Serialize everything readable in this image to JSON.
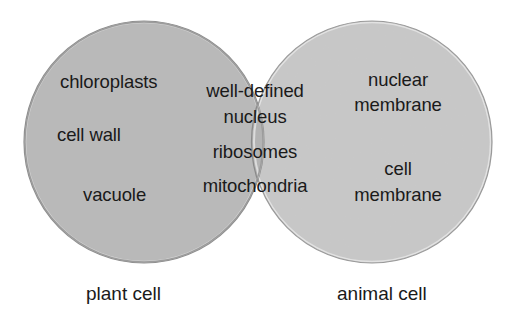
{
  "diagram": {
    "type": "venn",
    "sets": [
      {
        "name": "plant cell",
        "fill": "#b9b9b9",
        "unique_items": [
          "chloroplasts",
          "cell wall",
          "vacuole"
        ]
      },
      {
        "name": "animal cell",
        "fill": "#c8c8c8",
        "unique_items": [
          "nuclear membrane",
          "cell membrane"
        ]
      }
    ],
    "intersection": {
      "fill": "#b3b3b3",
      "items": [
        "well-defined nucleus",
        "ribosomes",
        "mitochondria"
      ]
    }
  },
  "labels": {
    "plant": {
      "item1": "chloroplasts",
      "item2": "cell wall",
      "item3": "vacuole",
      "caption": "plant cell"
    },
    "shared": {
      "line1": "well-defined",
      "line2": "nucleus",
      "line3": "ribosomes",
      "line4": "mitochondria"
    },
    "animal": {
      "item1_line1": "nuclear",
      "item1_line2": "membrane",
      "item2_line1": "cell",
      "item2_line2": "membrane",
      "caption": "animal cell"
    }
  }
}
